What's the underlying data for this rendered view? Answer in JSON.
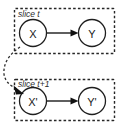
{
  "diagram": {
    "type": "two-time-slice-bayesian-network",
    "background_color": "#ffffff",
    "line_color": "#1a1a1a",
    "plates": [
      {
        "id": "slice-t",
        "label": "slice t",
        "label_style": "italic",
        "border_style": "dashed",
        "x": 14,
        "y": 8,
        "width": 101,
        "height": 46
      },
      {
        "id": "slice-t-plus-1",
        "label": "slice t+1",
        "label_style": "italic",
        "border_style": "dashed",
        "x": 14,
        "y": 79,
        "width": 101,
        "height": 42
      }
    ],
    "nodes": [
      {
        "id": "node-x",
        "label": "X",
        "cx": 33,
        "cy": 33,
        "r": 14,
        "plate": "slice-t"
      },
      {
        "id": "node-y",
        "label": "Y",
        "cx": 92,
        "cy": 33,
        "r": 14,
        "plate": "slice-t"
      },
      {
        "id": "node-x-prime",
        "label": "X'",
        "cx": 33,
        "cy": 101,
        "r": 14,
        "plate": "slice-t-plus-1"
      },
      {
        "id": "node-y-prime",
        "label": "Y'",
        "cx": 92,
        "cy": 101,
        "r": 14,
        "plate": "slice-t-plus-1"
      }
    ],
    "edges": [
      {
        "id": "edge-x-to-y",
        "from": "node-x",
        "to": "node-y",
        "style": "solid",
        "arrow": "filled"
      },
      {
        "id": "edge-xprime-to-yprime",
        "from": "node-x-prime",
        "to": "node-y-prime",
        "style": "solid",
        "arrow": "filled"
      },
      {
        "id": "edge-interslice-x-to-xprime",
        "from": "node-x",
        "to": "node-x-prime",
        "style": "dashed",
        "arrow": "filled",
        "shape": "curved-left"
      }
    ]
  }
}
